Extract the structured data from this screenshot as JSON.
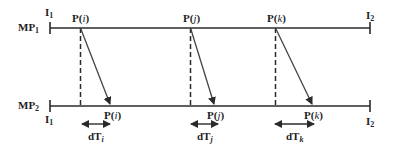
{
  "diagram": {
    "type": "timing-diagram",
    "colors": {
      "line": "#2a2a2a",
      "text": "#1f1f1f",
      "background": "#ffffff"
    },
    "timelines": [
      {
        "id": "mp1",
        "label": "MP",
        "label_sub": "1",
        "start_label": "I",
        "start_sub": "1",
        "end_label": "I",
        "end_sub": "2"
      },
      {
        "id": "mp2",
        "label": "MP",
        "label_sub": "2",
        "start_label": "I",
        "start_sub": "1",
        "end_label": "I",
        "end_sub": "2"
      }
    ],
    "packets": [
      {
        "id": "i",
        "send_label": "P(",
        "var": "i",
        "close": ")",
        "recv_label": "P(",
        "delay_label": "dT",
        "delay_sub": "i"
      },
      {
        "id": "j",
        "send_label": "P(",
        "var": "j",
        "close": ")",
        "recv_label": "P(",
        "delay_label": "dT",
        "delay_sub": "j"
      },
      {
        "id": "k",
        "send_label": "P(",
        "var": "k",
        "close": ")",
        "recv_label": "P(",
        "delay_label": "dT",
        "delay_sub": "k"
      }
    ]
  }
}
